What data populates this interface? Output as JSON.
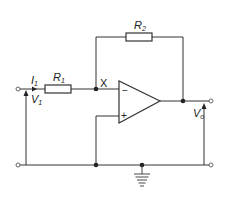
{
  "diagram": {
    "colors": {
      "line": "#333333",
      "background": "#ffffff"
    },
    "labels": {
      "i1_main": "I",
      "i1_sub": "1",
      "r1_main": "R",
      "r1_sub": "1",
      "r2_main": "R",
      "r2_sub": "2",
      "v1_main": "V",
      "v1_sub": "1",
      "vo_main": "V",
      "vo_sub": "o",
      "x": "X",
      "minus": "−",
      "plus": "+"
    },
    "components": [
      {
        "id": "R1",
        "type": "resistor",
        "label": "R1"
      },
      {
        "id": "R2",
        "type": "resistor",
        "label": "R2"
      },
      {
        "id": "opamp",
        "type": "op-amp",
        "inputs": [
          "inverting (-)",
          "non-inverting (+)"
        ]
      },
      {
        "id": "ground",
        "type": "ground"
      }
    ],
    "nodes": [
      "X (inverting input junction)",
      "output node",
      "ground rail"
    ]
  }
}
